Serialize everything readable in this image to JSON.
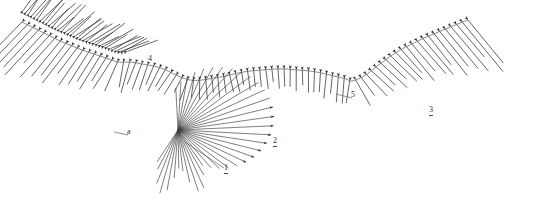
{
  "figure": {
    "background_color": "#ffffff",
    "line_color": "#3a3a3a",
    "curve_color": "#555555",
    "label_color": "#2b2b2b",
    "width": 540,
    "height": 202
  },
  "callouts": [
    {
      "id": "callout-1",
      "label": "1",
      "x": 228,
      "y": 170,
      "underline": true,
      "leader": {
        "x1": 224,
        "y1": 168,
        "x2": 185,
        "y2": 142
      }
    },
    {
      "id": "callout-2",
      "label": "2",
      "x": 277,
      "y": 143,
      "underline": true,
      "leader": null
    },
    {
      "id": "callout-3",
      "label": "3",
      "x": 433,
      "y": 112,
      "underline": true,
      "leader": null
    },
    {
      "id": "callout-4",
      "label": "4",
      "x": 152,
      "y": 61,
      "underline": false,
      "leader": null
    },
    {
      "id": "callout-5",
      "label": "5",
      "x": 355,
      "y": 97,
      "underline": false,
      "leader": {
        "x1": 352,
        "y1": 98,
        "x2": 336,
        "y2": 94
      }
    },
    {
      "id": "callout-6",
      "label": "a",
      "x": 131,
      "y": 134,
      "underline": false,
      "leader": {
        "x1": 128,
        "y1": 135,
        "x2": 114,
        "y2": 132
      }
    }
  ],
  "chart_data": {
    "type": "line",
    "xlabel": "",
    "ylabel": "",
    "xlim": [
      0,
      540
    ],
    "ylim": [
      0,
      202
    ],
    "grid": false,
    "legend": "none",
    "series": [
      {
        "name": "valley-profile-curve",
        "comment": "sampled (x,y) control points of the main basin curve, screen coordinates",
        "points": [
          [
            22,
            22
          ],
          [
            34,
            28
          ],
          [
            46,
            34
          ],
          [
            58,
            40
          ],
          [
            70,
            45
          ],
          [
            82,
            50
          ],
          [
            94,
            54
          ],
          [
            106,
            58
          ],
          [
            118,
            62
          ],
          [
            130,
            62
          ],
          [
            142,
            64
          ],
          [
            154,
            66
          ],
          [
            166,
            70
          ],
          [
            178,
            76
          ],
          [
            190,
            80
          ],
          [
            202,
            80
          ],
          [
            214,
            78
          ],
          [
            226,
            76
          ],
          [
            238,
            73
          ],
          [
            250,
            71
          ],
          [
            262,
            70
          ],
          [
            274,
            69
          ],
          [
            286,
            69
          ],
          [
            298,
            70
          ],
          [
            310,
            71
          ],
          [
            322,
            73
          ],
          [
            334,
            76
          ],
          [
            346,
            79
          ],
          [
            352,
            81
          ],
          [
            364,
            76
          ],
          [
            376,
            67
          ],
          [
            388,
            58
          ],
          [
            400,
            50
          ],
          [
            412,
            44
          ],
          [
            424,
            38
          ],
          [
            436,
            33
          ],
          [
            448,
            28
          ],
          [
            460,
            23
          ],
          [
            468,
            20
          ]
        ]
      },
      {
        "name": "dense-left-shoulder-cluster",
        "comment": "region of densest arrow packing",
        "x_range": [
          20,
          120
        ],
        "y_range": [
          14,
          70
        ]
      },
      {
        "name": "focal-fan",
        "comment": "convergence point of the long radiating rays",
        "focus": [
          178,
          130
        ]
      }
    ],
    "vector_field": {
      "arrow_count_main": 78,
      "arrow_count_fan": 26,
      "arrow_head": "filled-triangle",
      "arrow_length_min": 18,
      "arrow_length_max": 62
    }
  }
}
